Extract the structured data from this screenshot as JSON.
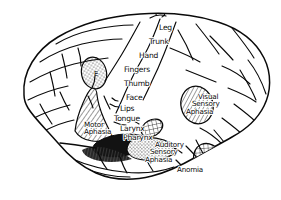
{
  "figure": {
    "background_color": "#ffffff",
    "ink_color": "#0a0a0a"
  },
  "homunculus_labels": [
    {
      "id": "leg",
      "text": "Leg",
      "x": 159,
      "y": 24
    },
    {
      "id": "trunk",
      "text": "Trunk",
      "x": 149,
      "y": 38
    },
    {
      "id": "hand",
      "text": "Hand",
      "x": 139,
      "y": 52
    },
    {
      "id": "fingers",
      "text": "Fingers",
      "x": 124,
      "y": 66
    },
    {
      "id": "thumb",
      "text": "Thumb",
      "x": 124,
      "y": 80
    },
    {
      "id": "face",
      "text": "Face",
      "x": 126,
      "y": 94
    },
    {
      "id": "lips",
      "text": "Lips",
      "x": 120,
      "y": 105
    },
    {
      "id": "tongue",
      "text": "Tongue",
      "x": 114,
      "y": 115
    },
    {
      "id": "larynx",
      "text": "Larynx",
      "x": 120,
      "y": 125
    },
    {
      "id": "pharynx",
      "text": "Pharynx",
      "x": 123,
      "y": 134
    }
  ],
  "region_labels": [
    {
      "id": "motor-aphasia",
      "lines": [
        "Motor",
        "Aphasia"
      ],
      "x": 84,
      "y": 121,
      "hatch": "diagonal"
    },
    {
      "id": "visual-sensory-aphasia",
      "lines": [
        "Visual",
        "Sensory",
        "Aphasia"
      ],
      "x": 198,
      "y": 93,
      "hatch": "diagonal"
    },
    {
      "id": "auditory-sensory-aphasia",
      "lines": [
        "Auditory",
        "Sensory",
        "Aphasia"
      ],
      "x": 155,
      "y": 141,
      "hatch": "stipple"
    },
    {
      "id": "anomia",
      "lines": [
        "Anomia"
      ],
      "x": 177,
      "y": 166,
      "hatch": "crosshatch"
    }
  ],
  "marker_labels": [
    {
      "id": "eye-field",
      "text": "E",
      "x": 94,
      "y": 74
    }
  ],
  "shaded_regions": [
    {
      "id": "eye-field-oval",
      "pattern": "stipple"
    },
    {
      "id": "motor-aphasia-area",
      "pattern": "diagonal"
    },
    {
      "id": "larynx-pharynx-oval",
      "pattern": "crosshatch"
    },
    {
      "id": "sylvian-dark-band",
      "pattern": "solid-dark"
    },
    {
      "id": "auditory-aphasia-area",
      "pattern": "stipple"
    },
    {
      "id": "visual-aphasia-oval",
      "pattern": "diagonal"
    },
    {
      "id": "anomia-oval",
      "pattern": "crosshatch"
    }
  ]
}
